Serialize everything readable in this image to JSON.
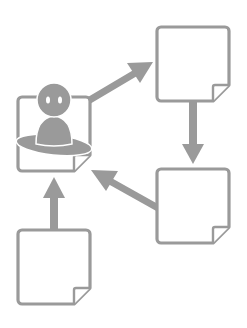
{
  "diagram": {
    "type": "flow-cycle",
    "colors": {
      "stroke": "#9a9a9a",
      "fill": "#ffffff",
      "arrow": "#9a9a9a",
      "person": "#9a9a9a",
      "person_eyes": "#ffffff"
    },
    "nodes": [
      {
        "id": "person-doc",
        "label": "",
        "icon": "person-icon",
        "x": 18,
        "y": 97,
        "w": 72,
        "h": 75
      },
      {
        "id": "doc-top-right",
        "label": "",
        "icon": "document-icon",
        "x": 157,
        "y": 27,
        "w": 72,
        "h": 74
      },
      {
        "id": "doc-mid-right",
        "label": "",
        "icon": "document-icon",
        "x": 157,
        "y": 169,
        "w": 72,
        "h": 75
      },
      {
        "id": "doc-bottom-left",
        "label": "",
        "icon": "document-icon",
        "x": 18,
        "y": 230,
        "w": 72,
        "h": 74
      }
    ],
    "edges": [
      {
        "from": "person-doc",
        "to": "doc-top-right",
        "direction": "up-right"
      },
      {
        "from": "doc-top-right",
        "to": "doc-mid-right",
        "direction": "down"
      },
      {
        "from": "doc-mid-right",
        "to": "person-doc",
        "direction": "up-left"
      },
      {
        "from": "doc-bottom-left",
        "to": "person-doc",
        "direction": "up"
      }
    ]
  }
}
